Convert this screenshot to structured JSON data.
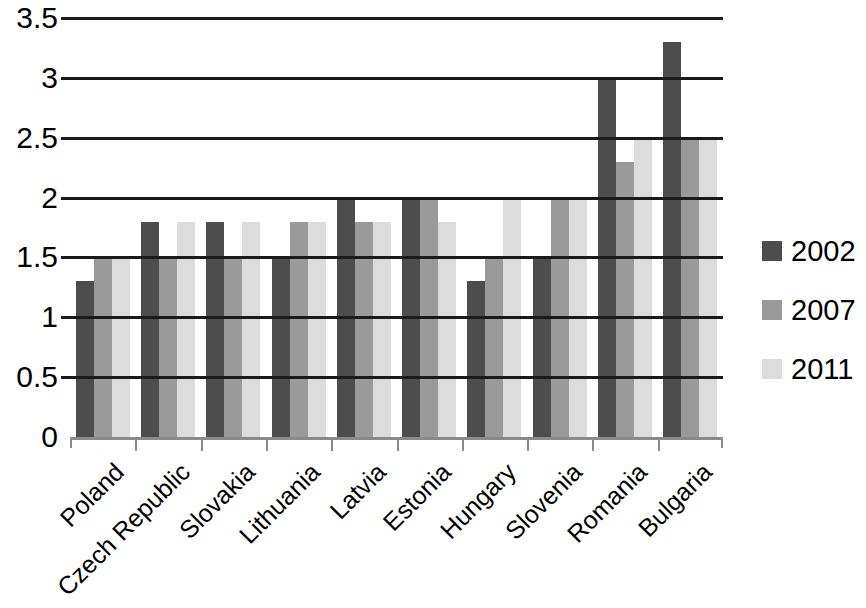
{
  "chart_data": {
    "type": "bar",
    "title": "",
    "subtitle": "",
    "xlabel": "",
    "ylabel": "",
    "ylim": [
      0,
      3.5
    ],
    "ytick_step": 0.5,
    "ytick_labels": [
      "3.5",
      "3",
      "2.5",
      "2",
      "1.5",
      "1",
      "0.5",
      "0"
    ],
    "ytick_values": [
      3.5,
      3,
      2.5,
      2,
      1.5,
      1,
      0.5,
      0
    ],
    "grid": "horizontal",
    "legend_position": "right",
    "categories": [
      "Poland",
      "Czech Republic",
      "Slovakia",
      "Lithuania",
      "Latvia",
      "Estonia",
      "Hungary",
      "Slovenia",
      "Romania",
      "Bulgaria"
    ],
    "series": [
      {
        "name": "2002",
        "color": "#4d4d4d",
        "values": [
          1.3,
          1.8,
          1.8,
          1.5,
          2.0,
          2.0,
          1.3,
          1.5,
          3.0,
          3.3
        ]
      },
      {
        "name": "2007",
        "color": "#9a9a9a",
        "values": [
          1.5,
          1.5,
          1.5,
          1.8,
          1.8,
          2.0,
          1.5,
          2.0,
          2.3,
          2.5
        ]
      },
      {
        "name": "2011",
        "color": "#dcdcdc",
        "values": [
          1.5,
          1.8,
          1.8,
          1.8,
          1.8,
          1.8,
          2.0,
          2.0,
          2.5,
          2.5
        ]
      }
    ]
  },
  "legend": {
    "items": [
      {
        "label": "2002",
        "color": "#4d4d4d"
      },
      {
        "label": "2007",
        "color": "#9a9a9a"
      },
      {
        "label": "2011",
        "color": "#dcdcdc"
      }
    ]
  },
  "colors": {
    "axis": "#8a8a8a",
    "gridline": "#1a1a1a",
    "text": "#000000",
    "background": "#ffffff"
  }
}
